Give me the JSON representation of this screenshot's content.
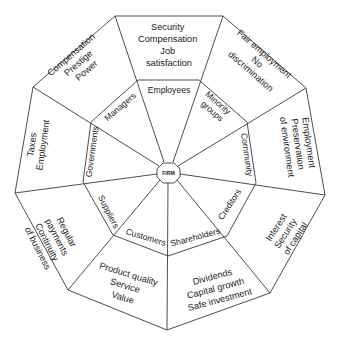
{
  "diagram": {
    "hub": {
      "label": "FIRM"
    },
    "colors": {
      "line": "#3a3a3a",
      "text": "#1a1a1a",
      "background": "#ffffff"
    },
    "segments": [
      {
        "stakeholder": "Employees",
        "interests": [
          "Security",
          "Compensation",
          "Job",
          "satisfaction"
        ]
      },
      {
        "stakeholder": "Minority groups",
        "stakeholder_lines": [
          "Minority",
          "groups"
        ],
        "interests": [
          "Fair employment",
          "No",
          "discrimination"
        ]
      },
      {
        "stakeholder": "Community",
        "interests": [
          "Employment",
          "Preservation",
          "of environment"
        ]
      },
      {
        "stakeholder": "Creditors",
        "interests": [
          "Interest",
          "Security",
          "of capital"
        ]
      },
      {
        "stakeholder": "Shareholders",
        "interests": [
          "Dividends",
          "Capital growth",
          "Safe investment"
        ]
      },
      {
        "stakeholder": "Customers",
        "interests": [
          "Product quality",
          "Service",
          "Value"
        ]
      },
      {
        "stakeholder": "Suppliers",
        "interests": [
          "Regular",
          "payments",
          "Continuity",
          "of business"
        ]
      },
      {
        "stakeholder": "Governments",
        "interests": [
          "Taxes",
          "Employment"
        ]
      },
      {
        "stakeholder": "Managers",
        "interests": [
          "Compensation",
          "Prestige",
          "Power"
        ]
      }
    ]
  }
}
